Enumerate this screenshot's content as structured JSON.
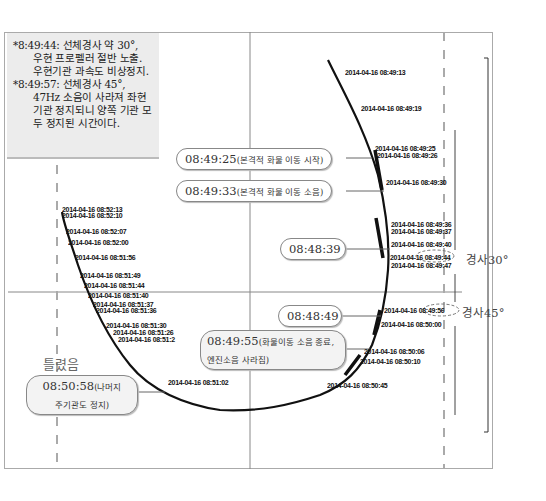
{
  "note": {
    "items": [
      {
        "lead": "*8:49:44: 선체경사 약 30°,",
        "body": "우현 프로펠러 절반 노출. 우현기관 과속도 비상정지."
      },
      {
        "lead": "*8:49:57: 선체경사 45°,",
        "body": "47Hz 소음이 사라져 좌현기관 정지되니 양쪽 기관 모두 정지된 시간이다."
      }
    ]
  },
  "callouts": [
    {
      "id": "c0825",
      "time": "08:49:25",
      "desc": "(본격적 화물 이동 시작)"
    },
    {
      "id": "c0833",
      "time": "08:49:33",
      "desc": "(본격적 화물 이동 소음)"
    },
    {
      "id": "c4839",
      "time": "08:48:39",
      "desc": ""
    },
    {
      "id": "c4849",
      "time": "08:48:49",
      "desc": ""
    },
    {
      "id": "c4955",
      "time": "08:49:55",
      "desc": "(화물이동 소음 종료,",
      "desc2": "엔진소음 사라짐)"
    },
    {
      "id": "c5058",
      "time": "08:50:58",
      "desc": "(나머지",
      "desc2": "주기관도 정지)"
    }
  ],
  "wrong_label": "틀렸음",
  "angles": {
    "a30": "경사30°",
    "a45": "경사45°"
  },
  "timestamps": {
    "right": [
      "2014-04-16 08:49:13",
      "2014-04-16 08:49:19",
      "2014-04-16 08:49:25",
      "2014-04-16 08:49:26",
      "2014-04-16 08:49:30",
      "2014-04-16 08:49:36",
      "2014-04-16 08:49:37",
      "2014-04-16 08:49:40",
      "2014-04-16 08:49:44",
      "2014-04-16 08:49:47",
      "2014-04-16 08:49:56",
      "2014-04-16 08:50:00",
      "2014-04-16 08:50:06",
      "2014-04-16 08:50:10",
      "2014-04-16 08:50:45"
    ],
    "left": [
      "2014-04-16 08:52:13",
      "2014-04-16 08:52:10",
      "2014-04-16 08:52:07",
      "2014-04-16 08:52:00",
      "2014-04-16 08:51:56",
      "2014-04-16 08:51:49",
      "2014-04-16 08:51:44",
      "2014-04-16 08:51:40",
      "2014-04-16 08:51:37",
      "2014-04-16 08:51:36",
      "2014-04-16 08:51:30",
      "2014-04-16 08:51:26",
      "2014-04-16 08:51:2",
      "2014-04-16 08:51:02"
    ]
  },
  "colors": {
    "curve": "#111111",
    "grid": "#888888",
    "dashed": "#999999",
    "note_bg": "#ececec"
  }
}
